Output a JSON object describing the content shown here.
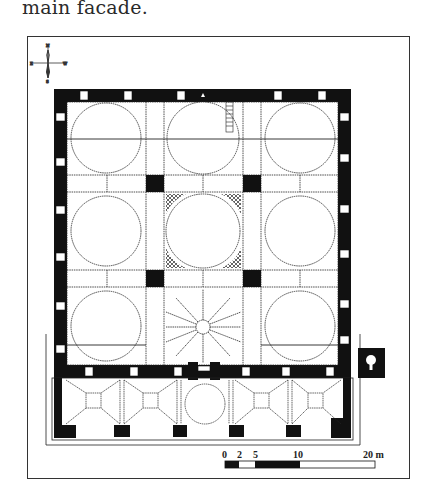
{
  "caption": "main facade.",
  "compass": {
    "north": "N",
    "south": "S",
    "east": "E",
    "west": "W"
  },
  "scale_bar": {
    "ticks": [
      "0",
      "2",
      "5",
      "10",
      "20 m"
    ],
    "unit": "m"
  },
  "plan": {
    "description": "Floor plan of a nine-domed mosque with five-bay portico",
    "domes_main_hall": 9,
    "portico_bays": 5,
    "colors": {
      "wall": "#111111",
      "line": "#222222",
      "background": "#ffffff"
    }
  }
}
